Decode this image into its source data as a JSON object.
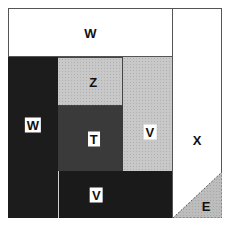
{
  "diagram": {
    "regions": [
      {
        "id": "w-top",
        "label": "W",
        "fill": "#ffffff"
      },
      {
        "id": "w-left",
        "label": "W",
        "fill": "#1c1c1c"
      },
      {
        "id": "z",
        "label": "Z",
        "fill": "#c9c9c9"
      },
      {
        "id": "t",
        "label": "T",
        "fill": "#3a3a3a"
      },
      {
        "id": "v-right",
        "label": "V",
        "fill": "#cdcdcd"
      },
      {
        "id": "v-bottom",
        "label": "V",
        "fill": "#1a1a1a"
      },
      {
        "id": "x",
        "label": "X",
        "fill": "#ffffff"
      },
      {
        "id": "e",
        "label": "E",
        "fill": "#b8b8b8"
      }
    ],
    "border_color": "#555555"
  }
}
